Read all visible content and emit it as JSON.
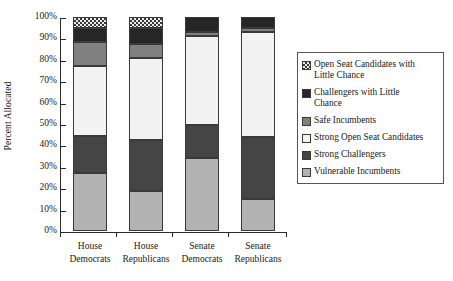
{
  "chart_data": {
    "type": "bar",
    "subtype": "stacked-bar-100-percent",
    "title": "",
    "subtitle": "",
    "xlabel": "",
    "ylabel": "Percent Allocated",
    "ylim": [
      0,
      100
    ],
    "ytick_labels": [
      "100%",
      "90%",
      "80%",
      "70%",
      "60%",
      "50%",
      "40%",
      "30%",
      "20%",
      "10%",
      "0%"
    ],
    "ytick_values": [
      100,
      90,
      80,
      70,
      60,
      50,
      40,
      30,
      20,
      10,
      0
    ],
    "grid": false,
    "legend_position": "right-inside",
    "categories": [
      "House Democrats",
      "House Republicans",
      "Senate Democrats",
      "Senate Republicans"
    ],
    "category_lines": [
      [
        "House",
        "Democrats"
      ],
      [
        "House",
        "Republicans"
      ],
      [
        "Senate",
        "Democrats"
      ],
      [
        "Senate",
        "Republicans"
      ]
    ],
    "series": [
      {
        "name": "Vulnerable Incumbents",
        "color": "#b3b3b3",
        "pattern": "solid",
        "values": [
          27.0,
          18.5,
          34.0,
          15.0
        ]
      },
      {
        "name": "Strong Challengers",
        "color": "#454545",
        "pattern": "solid",
        "values": [
          17.5,
          24.0,
          15.5,
          29.0
        ]
      },
      {
        "name": "Strong Open Seat Candidates",
        "color": "#f2f2f2",
        "pattern": "solid",
        "values": [
          32.5,
          38.5,
          41.5,
          49.0
        ]
      },
      {
        "name": "Safe Incumbents",
        "color": "#808080",
        "pattern": "solid",
        "values": [
          11.5,
          6.5,
          2.0,
          2.0
        ]
      },
      {
        "name": "Challengers with Little Chance",
        "color": "#262626",
        "pattern": "solid",
        "values": [
          6.5,
          7.5,
          7.0,
          5.0
        ]
      },
      {
        "name": "Open Seat Candidates with Little Chance",
        "color": "#e8e8e8",
        "pattern": "checkered",
        "values": [
          5.0,
          5.0,
          0.0,
          0.0
        ]
      }
    ],
    "legend_entries": [
      {
        "label_lines": [
          "Open Seat Candidates with",
          "Little Chance"
        ],
        "color": "#e8e8e8",
        "pattern": "checkered"
      },
      {
        "label_lines": [
          "Challengers with Little",
          "Chance"
        ],
        "color": "#262626",
        "pattern": "solid"
      },
      {
        "label_lines": [
          "Safe Incumbents"
        ],
        "color": "#808080",
        "pattern": "solid"
      },
      {
        "label_lines": [
          "Strong Open Seat Candidates"
        ],
        "color": "#f2f2f2",
        "pattern": "solid"
      },
      {
        "label_lines": [
          "Strong Challengers"
        ],
        "color": "#454545",
        "pattern": "solid"
      },
      {
        "label_lines": [
          "Vulnerable Incumbents"
        ],
        "color": "#b3b3b3",
        "pattern": "solid"
      }
    ]
  }
}
